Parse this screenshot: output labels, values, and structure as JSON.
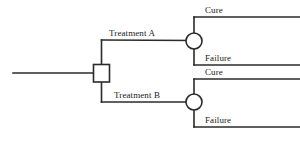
{
  "diagram": {
    "type": "decision-tree",
    "colors": {
      "stroke": "#2b2b2b",
      "node_fill": "#ffffff",
      "text": "#1a1a1a",
      "background": "#ffffff"
    },
    "root": {
      "node_name": "decision-node",
      "shape": "square"
    },
    "branches": [
      {
        "label": "Treatment A",
        "chance_node_name": "chance-node-a",
        "outcomes": [
          {
            "label": "Cure"
          },
          {
            "label": "Failure"
          }
        ]
      },
      {
        "label": "Treatment B",
        "chance_node_name": "chance-node-b",
        "outcomes": [
          {
            "label": "Cure"
          },
          {
            "label": "Failure"
          }
        ]
      }
    ]
  }
}
